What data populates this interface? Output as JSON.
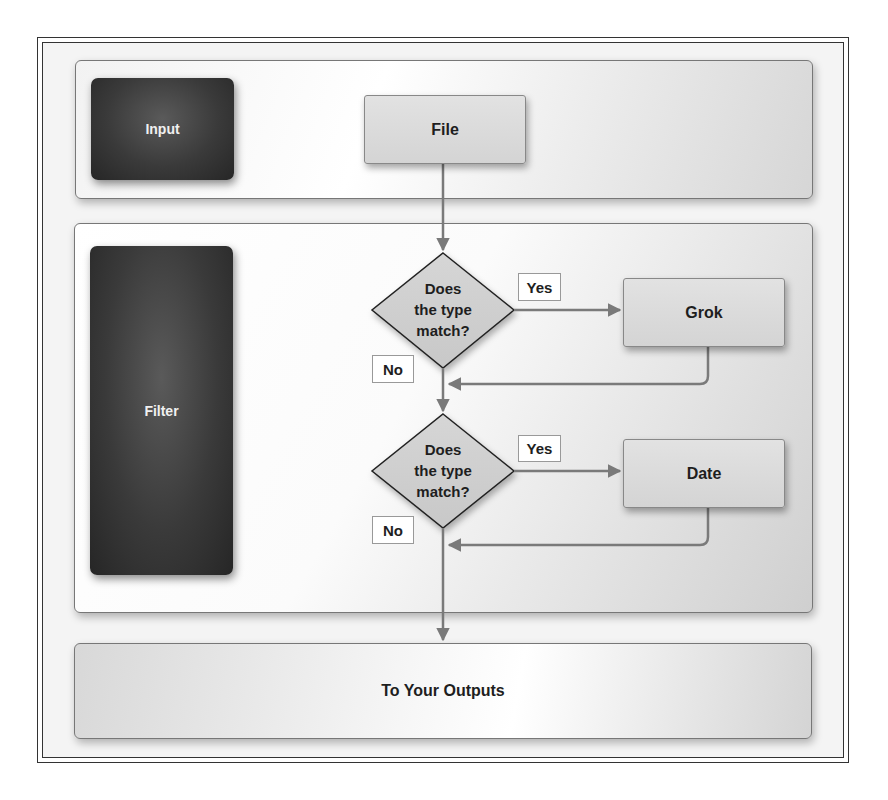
{
  "diagram": {
    "stages": {
      "input": {
        "label": "Input"
      },
      "filter": {
        "label": "Filter"
      }
    },
    "nodes": {
      "file": {
        "label": "File"
      },
      "decision_1": {
        "line1": "Does",
        "line2": "the type",
        "line3": "match?"
      },
      "grok": {
        "label": "Grok"
      },
      "decision_2": {
        "line1": "Does",
        "line2": "the type",
        "line3": "match?"
      },
      "date": {
        "label": "Date"
      },
      "output": {
        "label": "To Your Outputs"
      }
    },
    "edge_labels": {
      "yes_1": "Yes",
      "no_1": "No",
      "yes_2": "Yes",
      "no_2": "No"
    },
    "colors": {
      "stage_block": "#3a3a3a",
      "process_box": "#d9d9d9",
      "decision_fill": "#cfcfcf",
      "connector": "#7a7a7a"
    }
  }
}
